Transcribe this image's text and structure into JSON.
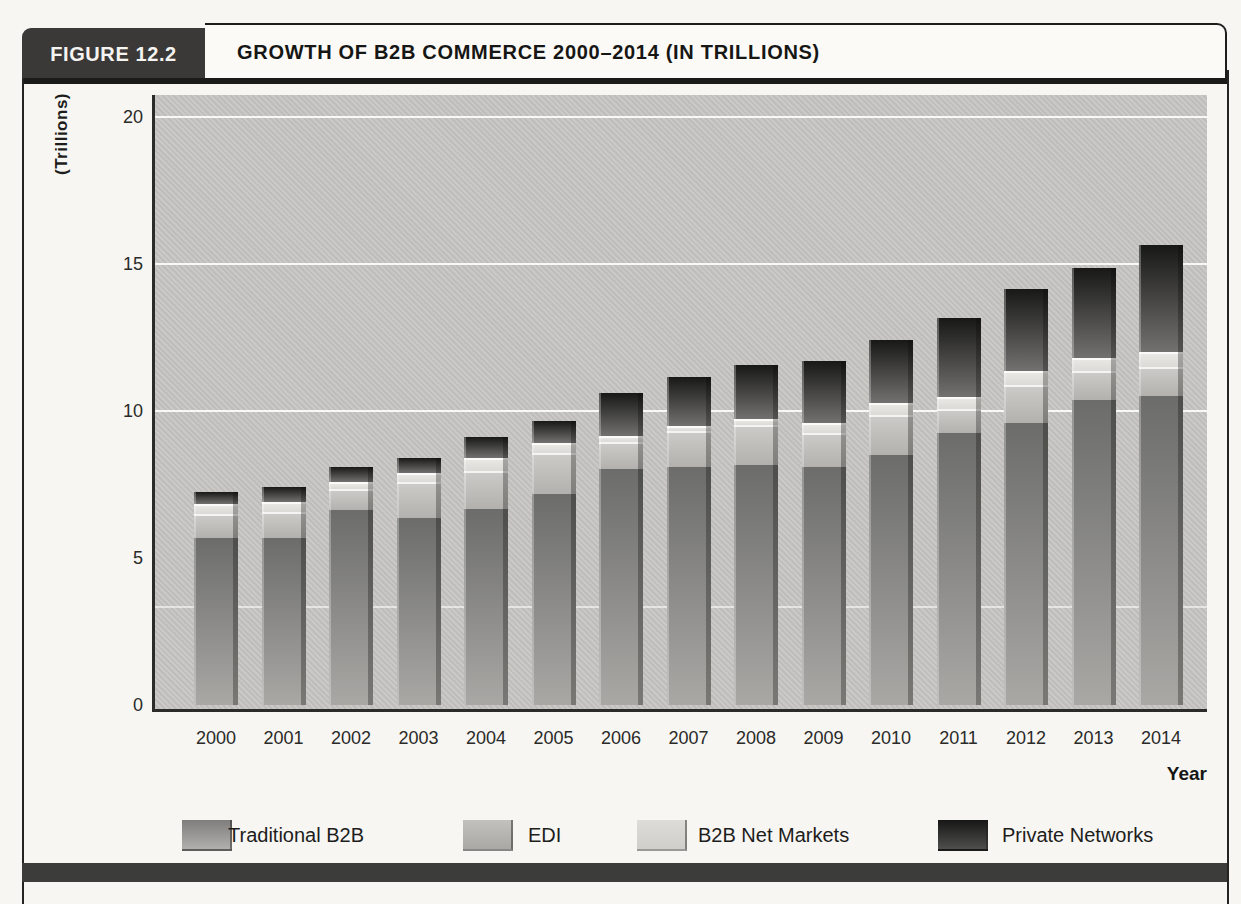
{
  "figure": {
    "label": "FIGURE 12.2",
    "title": "GROWTH OF B2B COMMERCE 2000–2014 (IN TRILLIONS)"
  },
  "chart_data": {
    "type": "bar",
    "stacked": true,
    "title": "Growth of B2B Commerce 2000–2014 (in trillions)",
    "xlabel": "Year",
    "ylabel": "(Trillions)",
    "ylim": [
      0,
      20
    ],
    "yticks": [
      0,
      5,
      10,
      15,
      20
    ],
    "gridlines_at": [
      10,
      15,
      20
    ],
    "faint_line_at": 3.33,
    "grid": "horizontal white lines on gray plot background",
    "legend_position": "bottom",
    "categories": [
      "2000",
      "2001",
      "2002",
      "2003",
      "2004",
      "2005",
      "2006",
      "2007",
      "2008",
      "2009",
      "2010",
      "2011",
      "2012",
      "2013",
      "2014"
    ],
    "series": [
      {
        "name": "Traditional B2B",
        "color_top": "#6c6c6a",
        "color_bottom": "#a9a8a5",
        "values": [
          5.7,
          5.65,
          6.65,
          6.35,
          6.65,
          7.15,
          8.0,
          8.1,
          8.15,
          8.1,
          8.5,
          9.25,
          9.6,
          10.35,
          10.5
        ]
      },
      {
        "name": "EDI",
        "color_top": "#cbcac7",
        "color_bottom": "#b2b1ae",
        "values": [
          0.8,
          0.9,
          0.7,
          1.25,
          1.3,
          1.4,
          0.95,
          1.2,
          1.35,
          1.15,
          1.35,
          0.8,
          1.3,
          1.0,
          1.0
        ]
      },
      {
        "name": "B2B Net Markets",
        "color_top": "#e8e7e4",
        "color_bottom": "#dbdad7",
        "values": [
          0.35,
          0.35,
          0.25,
          0.3,
          0.45,
          0.35,
          0.2,
          0.2,
          0.2,
          0.35,
          0.4,
          0.4,
          0.45,
          0.45,
          0.5
        ]
      },
      {
        "name": "Private Networks",
        "color_top": "#181817",
        "color_bottom": "#727170",
        "values": [
          0.4,
          0.5,
          0.5,
          0.5,
          0.7,
          0.75,
          1.45,
          1.65,
          1.85,
          2.1,
          2.15,
          2.7,
          2.8,
          3.05,
          3.65
        ]
      }
    ],
    "totals": [
      7.25,
      7.4,
      8.1,
      8.4,
      9.1,
      9.65,
      10.6,
      11.15,
      11.55,
      11.7,
      12.4,
      13.15,
      14.15,
      14.85,
      15.65
    ]
  },
  "legend": {
    "items": [
      {
        "label": "Traditional B2B",
        "swatch_top": "#7f7e7c",
        "swatch_bottom": "#b0afac"
      },
      {
        "label": "EDI",
        "swatch_top": "#c2c1be",
        "swatch_bottom": "#a9a8a5"
      },
      {
        "label": "B2B Net Markets",
        "swatch_top": "#dddcd9",
        "swatch_bottom": "#cfcecb"
      },
      {
        "label": "Private Networks",
        "swatch_top": "#171717",
        "swatch_bottom": "#4e4e4c"
      }
    ]
  },
  "colors": {
    "plot_background": "#c7c6c3",
    "frame": "#242422",
    "header_box": "#3a3938",
    "bottom_band": "#3c3c3a",
    "page_background": "#f7f6f3"
  }
}
